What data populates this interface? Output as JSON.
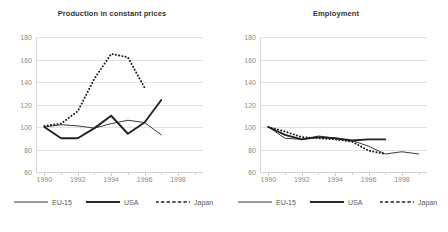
{
  "legend": {
    "entries": [
      {
        "label": "EU-15",
        "style": "solid-thin"
      },
      {
        "label": "USA",
        "style": "solid-thick"
      },
      {
        "label": "Japan",
        "style": "dotted"
      }
    ]
  },
  "axis": {
    "yticks": [
      180,
      160,
      140,
      120,
      100,
      80,
      60
    ],
    "xticks": [
      1990,
      1992,
      1994,
      1996,
      1998
    ]
  },
  "chart_data": [
    {
      "type": "line",
      "title": "Production in constant prices",
      "xlabel": "",
      "ylabel": "",
      "xlim": [
        1989.5,
        1999.5
      ],
      "ylim": [
        60,
        180
      ],
      "grid": true,
      "legend_position": "bottom",
      "series": [
        {
          "name": "EU-15",
          "style": "solid-thin",
          "x": [
            1990,
            1991,
            1992,
            1993,
            1994,
            1995,
            1996,
            1997
          ],
          "values": [
            100,
            102,
            101,
            99,
            103,
            106,
            104,
            93
          ]
        },
        {
          "name": "USA",
          "style": "solid-thick",
          "x": [
            1990,
            1991,
            1992,
            1993,
            1994,
            1995,
            1996,
            1997
          ],
          "values": [
            100,
            90,
            90,
            99,
            110,
            94,
            104,
            124
          ]
        },
        {
          "name": "Japan",
          "style": "dotted",
          "x": [
            1990,
            1991,
            1992,
            1993,
            1994,
            1995,
            1996
          ],
          "values": [
            101,
            103,
            114,
            143,
            165,
            162,
            135
          ]
        }
      ]
    },
    {
      "type": "line",
      "title": "Employment",
      "xlabel": "",
      "ylabel": "",
      "xlim": [
        1989.5,
        1999.5
      ],
      "ylim": [
        60,
        180
      ],
      "grid": true,
      "legend_position": "bottom",
      "series": [
        {
          "name": "EU-15",
          "style": "solid-thin",
          "x": [
            1990,
            1991,
            1992,
            1993,
            1994,
            1995,
            1996,
            1997,
            1998,
            1999
          ],
          "values": [
            100,
            90,
            89,
            92,
            90,
            88,
            83,
            76,
            78,
            76
          ]
        },
        {
          "name": "USA",
          "style": "solid-thick",
          "x": [
            1990,
            1991,
            1992,
            1993,
            1994,
            1995,
            1996,
            1997
          ],
          "values": [
            100,
            93,
            89,
            91,
            90,
            88,
            89,
            89
          ]
        },
        {
          "name": "Japan",
          "style": "dotted",
          "x": [
            1990,
            1991,
            1992,
            1993,
            1994,
            1995,
            1996,
            1997
          ],
          "values": [
            100,
            96,
            91,
            90,
            89,
            87,
            79,
            76
          ]
        }
      ]
    }
  ]
}
